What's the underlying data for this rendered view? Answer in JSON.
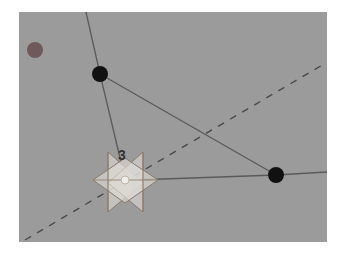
{
  "viewport": {
    "background": "#9b9b9b",
    "vertex_label": "3"
  },
  "scene": {
    "vertices": [
      {
        "id": 1,
        "x": 100,
        "y": 74,
        "color": "#111111"
      },
      {
        "id": 2,
        "x": 276,
        "y": 175,
        "color": "#111111"
      },
      {
        "id": 3,
        "x": 125,
        "y": 180,
        "color": "#d8d8d8",
        "selected": true,
        "label": "3"
      }
    ],
    "marker": {
      "x": 35,
      "y": 50,
      "color": "#6e5a5a"
    },
    "edge_color": "#5a5a5a",
    "axis_color": "#4a4a4a",
    "manipulator_color": "#8a7a6a",
    "manipulator_fill": "#d6d3cd"
  }
}
